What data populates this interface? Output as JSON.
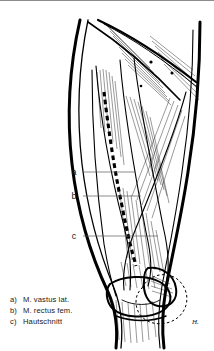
{
  "figure": {
    "name": "anterior-thigh-lateral-approach",
    "background_color": "#ffffff",
    "ink_color": "#000000",
    "border_color": "#8c8c8c",
    "leader_color": "#5a5a5a"
  },
  "callouts": [
    {
      "key": "a",
      "x": 76,
      "y": 175,
      "line_to_x": 136
    },
    {
      "key": "b",
      "x": 76,
      "y": 199,
      "line_to_x": 141
    },
    {
      "key": "c",
      "x": 76,
      "y": 239,
      "line_to_x": 158
    }
  ],
  "legend": {
    "items": [
      {
        "key": "a)",
        "text": "M. vastus lat."
      },
      {
        "key": "b)",
        "text": "M. rectus fem."
      },
      {
        "key": "c)",
        "text": "Hautschnitt"
      }
    ]
  },
  "signature": {
    "mark": "H.",
    "x": 192,
    "y": 324
  }
}
